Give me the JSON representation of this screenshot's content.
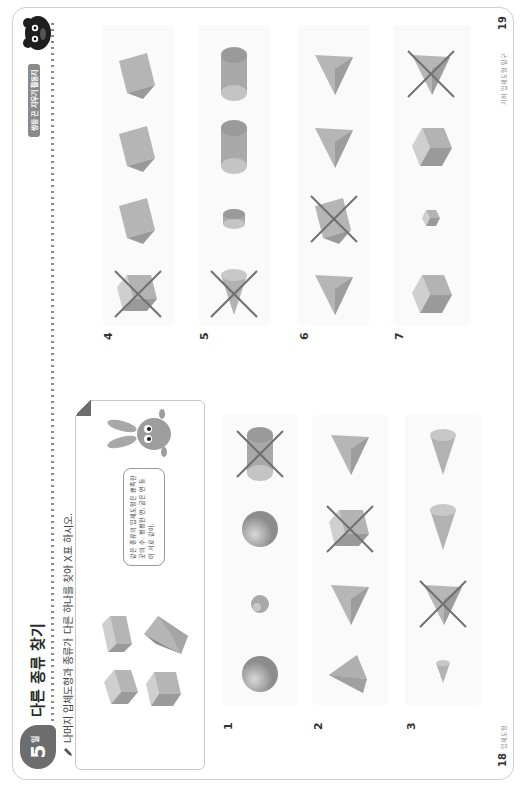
{
  "header": {
    "day_number": "5",
    "day_unit": "일",
    "title": "다른 종류 찾기",
    "right_tag": "쌍둥 끈 지우기 활동지"
  },
  "instruction": "나머지 입체도형과 종류가 다른 하나를 찾아 X표 하시오.",
  "example": {
    "shapes": [
      "rectangular-prism",
      "triangular-prism",
      "rectangular-prism",
      "rectangular-prism"
    ],
    "speech_bubble": "같은 종류의 입체도형은 뾰족한 곳의 수, 평평한 면, 굽은 면 등이 서로 같아."
  },
  "problems": [
    {
      "number": "1",
      "shapes": [
        "sphere",
        "sphere-small",
        "sphere",
        "cylinder"
      ],
      "crossed_index": 3
    },
    {
      "number": "2",
      "shapes": [
        "square-pyramid",
        "triangular-pyramid",
        "rectangular-prism",
        "triangular-pyramid"
      ],
      "crossed_index": 2
    },
    {
      "number": "3",
      "shapes": [
        "cone-small",
        "triangular-pyramid",
        "cone",
        "cone"
      ],
      "crossed_index": 1
    },
    {
      "number": "4",
      "shapes": [
        "rectangular-prism",
        "triangular-prism",
        "triangular-prism",
        "triangular-prism"
      ],
      "crossed_index": 0
    },
    {
      "number": "5",
      "shapes": [
        "cone",
        "cylinder-small",
        "cylinder",
        "cylinder"
      ],
      "crossed_index": 0
    },
    {
      "number": "6",
      "shapes": [
        "triangular-pyramid",
        "triangular-prism",
        "triangular-pyramid",
        "triangular-pyramid"
      ],
      "crossed_index": 1
    },
    {
      "number": "7",
      "shapes": [
        "cube",
        "cube-small",
        "cube",
        "triangular-pyramid"
      ],
      "crossed_index": 3
    }
  ],
  "footer": {
    "left_page_number": "18",
    "left_page_text": "입체도형",
    "right_page_number": "19",
    "right_page_text": "기하 입체도형 탐구"
  },
  "colors": {
    "badge": "#6d6d6d",
    "shape_fill": "#b8b8b8",
    "cross_mark": "#707070",
    "border": "#cfcfcf"
  }
}
